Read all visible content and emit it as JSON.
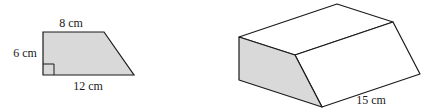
{
  "trapezoid": {
    "top_label": "8 cm",
    "height_label": "6 cm",
    "bottom_label": "12 cm",
    "fill": "#d9d9d9",
    "stroke": "#1a1a1a"
  },
  "prism": {
    "length_label": "15 cm",
    "face_fill": "#d9d9d9",
    "stroke": "#1a1a1a"
  }
}
